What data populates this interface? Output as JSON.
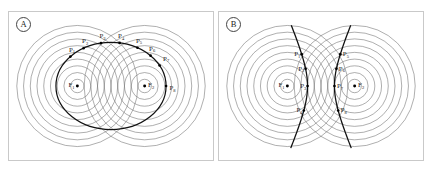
{
  "figure": {
    "background": "#ffffff",
    "circle_color": "#6b6b6b",
    "conic_color": "#111111",
    "point_color": "#000000",
    "border_color": "#c9c9c9"
  },
  "panels": [
    {
      "tag": "A",
      "caption_hidden": "",
      "conic_type": "ellipse",
      "focus_labels": [
        "F1",
        "F2"
      ],
      "focus_display": [
        "F",
        "F"
      ],
      "focus_sub": [
        "1",
        "2"
      ],
      "point_labels": [
        "P1",
        "P2",
        "P3",
        "P4",
        "P5",
        "P6",
        "P7",
        "P8"
      ],
      "point_display": "P",
      "point_subs": [
        "1",
        "2",
        "3",
        "4",
        "5",
        "6",
        "7",
        "8"
      ],
      "circle_count": 9
    },
    {
      "tag": "B",
      "caption_hidden": "",
      "conic_type": "hyperbola",
      "focus_labels": [
        "F1",
        "F2"
      ],
      "focus_display": [
        "F",
        "F"
      ],
      "focus_sub": [
        "1",
        "2"
      ],
      "point_labels": [
        "P1",
        "P2",
        "P3",
        "P4",
        "P5",
        "P6",
        "P7",
        "P8"
      ],
      "point_display": "P",
      "point_subs": [
        "1",
        "2",
        "3",
        "4",
        "5",
        "6",
        "7",
        "8"
      ],
      "circle_count": 9
    }
  ],
  "chart_data": {
    "type": "scatter",
    "title": "",
    "subtitle": "",
    "xlabel": "",
    "ylabel": "",
    "grid": false,
    "legend": null,
    "panels": [
      {
        "tag": "A",
        "curve": "ellipse",
        "focus1": {
          "label": "F1",
          "x": -55,
          "y": 0
        },
        "focus2": {
          "label": "F2",
          "x": 55,
          "y": 0
        },
        "semi_major": 90,
        "semi_minor": 62,
        "radii": [
          11,
          22,
          33,
          44,
          55,
          66,
          77,
          88,
          99
        ],
        "marked_points": [
          {
            "label": "P1",
            "x": -62,
            "y": 45
          },
          {
            "label": "P2",
            "x": -40,
            "y": 55
          },
          {
            "label": "P3",
            "x": -14,
            "y": 60
          },
          {
            "label": "P4",
            "x": 12,
            "y": 60
          },
          {
            "label": "P5",
            "x": 38,
            "y": 55
          },
          {
            "label": "P6",
            "x": 60,
            "y": 46
          },
          {
            "label": "P7",
            "x": 76,
            "y": 32
          },
          {
            "label": "P8",
            "x": 90,
            "y": 0
          }
        ]
      },
      {
        "tag": "B",
        "curve": "hyperbola",
        "focus1": {
          "label": "F1",
          "x": -55,
          "y": 0
        },
        "focus2": {
          "label": "F2",
          "x": 55,
          "y": 0
        },
        "semi_transverse": 22,
        "radii": [
          11,
          22,
          33,
          44,
          55,
          66,
          77,
          88,
          99
        ],
        "marked_points": [
          {
            "label": "P1",
            "x": -26,
            "y": 52
          },
          {
            "label": "P2",
            "x": -24,
            "y": 28
          },
          {
            "label": "P3",
            "x": -22,
            "y": 0
          },
          {
            "label": "P4",
            "x": -24,
            "y": -40
          },
          {
            "label": "P5",
            "x": 26,
            "y": 52
          },
          {
            "label": "P6",
            "x": 24,
            "y": 28
          },
          {
            "label": "P7",
            "x": 22,
            "y": 0
          },
          {
            "label": "P8",
            "x": 24,
            "y": -40
          }
        ]
      }
    ]
  }
}
